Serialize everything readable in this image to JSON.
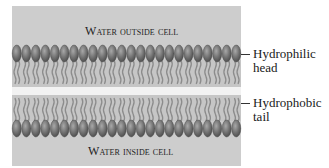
{
  "diagram": {
    "regions": {
      "outside": "Water outside cell",
      "inside": "Water inside cell"
    },
    "labels": {
      "head": {
        "line1": "Hydrophilic",
        "line2": "head"
      },
      "tail": {
        "line1": "Hydrophobic",
        "line2": "tail"
      }
    },
    "layout": {
      "box": {
        "x": 12,
        "y": 6,
        "width": 229,
        "height": 160
      },
      "head_count": 24,
      "top_heads_y": [
        45,
        62
      ],
      "upper_tails_y": [
        62,
        88
      ],
      "gap_y": [
        88,
        95
      ],
      "lower_tails_y": [
        95,
        120
      ],
      "bottom_heads_y": [
        120,
        137
      ]
    },
    "colors": {
      "water": "#cdcdcd",
      "head_dark": "#5a5a5a",
      "head_light": "#9a9a9a",
      "tail": "#8c8c8c",
      "tail_region": "#c4c4c4",
      "gap": "#f2f2f2"
    }
  }
}
